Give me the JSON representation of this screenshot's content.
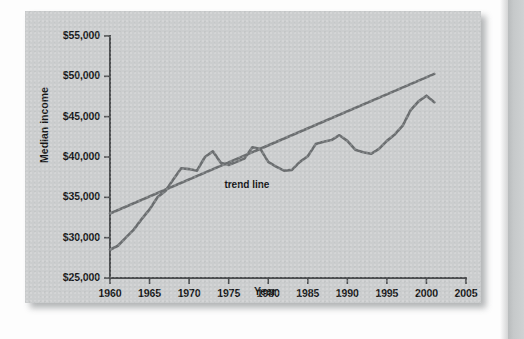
{
  "figure": {
    "y_axis_title": "Median income",
    "x_axis_title": "Year",
    "trend_annotation": "trend line"
  },
  "chart_data": {
    "type": "line",
    "title": "",
    "subtitle": "",
    "xlabel": "Year",
    "ylabel": "Median income",
    "xlim": [
      1960,
      2005
    ],
    "ylim": [
      25000,
      55000
    ],
    "grid": false,
    "legend": null,
    "annotations": [
      {
        "text": "trend line",
        "x": 1978,
        "y": 38000
      }
    ],
    "x_ticks": [
      1960,
      1965,
      1970,
      1975,
      1980,
      1985,
      1990,
      1995,
      2000,
      2005
    ],
    "x_tick_labels": [
      "1960",
      "1965",
      "1970",
      "1975",
      "1980",
      "1985",
      "1990",
      "1995",
      "2000",
      "2005"
    ],
    "y_ticks": [
      25000,
      30000,
      35000,
      40000,
      45000,
      50000,
      55000
    ],
    "y_tick_labels": [
      "$25,000",
      "$30,000",
      "$35,000",
      "$40,000",
      "$45,000",
      "$50,000",
      "$55,000"
    ],
    "series": [
      {
        "name": "Median income",
        "type": "line",
        "color": "#6b6e70",
        "x": [
          1960,
          1961,
          1962,
          1963,
          1964,
          1965,
          1966,
          1967,
          1968,
          1969,
          1970,
          1971,
          1972,
          1973,
          1974,
          1975,
          1976,
          1977,
          1978,
          1979,
          1980,
          1981,
          1982,
          1983,
          1984,
          1985,
          1986,
          1987,
          1988,
          1989,
          1990,
          1991,
          1992,
          1993,
          1994,
          1995,
          1996,
          1997,
          1998,
          1999,
          2000,
          2001
        ],
        "values": [
          28500,
          29000,
          30000,
          31000,
          32300,
          33500,
          35000,
          35800,
          37200,
          38600,
          38500,
          38300,
          40000,
          40700,
          39300,
          39000,
          39400,
          39800,
          41200,
          41000,
          39400,
          38800,
          38300,
          38400,
          39400,
          40100,
          41600,
          41900,
          42100,
          42700,
          42000,
          40900,
          40600,
          40400,
          41000,
          42000,
          42800,
          43900,
          45800,
          46900,
          47600,
          46800
        ]
      },
      {
        "name": "trend line",
        "type": "line",
        "color": "#6b6e70",
        "x": [
          1960,
          2001
        ],
        "values": [
          33000,
          50300
        ]
      }
    ]
  }
}
